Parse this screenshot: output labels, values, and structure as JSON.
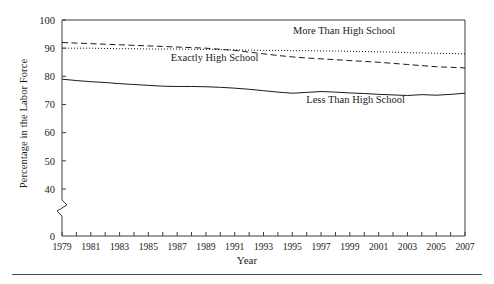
{
  "chart_data": {
    "type": "line",
    "title": "",
    "xlabel": "Year",
    "ylabel": "Percentage in the Labor Force",
    "xlim": [
      1979,
      2007
    ],
    "ylim": [
      0,
      100
    ],
    "y_ticks": [
      0,
      40,
      50,
      60,
      70,
      80,
      90,
      100
    ],
    "y_axis_break": true,
    "y_axis_break_between": [
      0,
      40
    ],
    "grid": false,
    "legend_position": "inline-annotations",
    "x": [
      1979,
      1980,
      1981,
      1982,
      1983,
      1984,
      1985,
      1986,
      1987,
      1988,
      1989,
      1990,
      1991,
      1992,
      1993,
      1994,
      1995,
      1996,
      1997,
      1998,
      1999,
      2000,
      2001,
      2002,
      2003,
      2004,
      2005,
      2006,
      2007
    ],
    "x_tick_labels": [
      "1979",
      "1981",
      "1983",
      "1985",
      "1987",
      "1989",
      "1991",
      "1993",
      "1995",
      "1997",
      "1999",
      "2001",
      "2003",
      "2005",
      "2007"
    ],
    "series": [
      {
        "name": "More Than High School",
        "style": "dotted",
        "label_x": 1998.6,
        "label_y": 95.2,
        "values": [
          90.0,
          90.0,
          90.0,
          89.9,
          89.8,
          89.8,
          89.7,
          89.7,
          89.7,
          89.6,
          89.6,
          89.5,
          89.4,
          89.3,
          89.2,
          89.2,
          89.1,
          89.1,
          89.0,
          89.0,
          88.9,
          88.8,
          88.7,
          88.6,
          88.4,
          88.3,
          88.2,
          88.1,
          88.0
        ]
      },
      {
        "name": "Exactly High School",
        "style": "dashed",
        "label_x": 1989.6,
        "label_y": 85.4,
        "values": [
          92.0,
          91.8,
          91.6,
          91.4,
          91.2,
          91.0,
          90.8,
          90.6,
          90.4,
          90.2,
          90.0,
          89.6,
          89.2,
          88.6,
          88.0,
          87.4,
          86.9,
          86.5,
          86.2,
          85.9,
          85.6,
          85.3,
          85.0,
          84.6,
          84.2,
          83.8,
          83.4,
          83.2,
          83.0
        ]
      },
      {
        "name": "Less Than High School",
        "style": "solid",
        "label_x": 1999.4,
        "label_y": 70.6,
        "values": [
          79.0,
          78.5,
          78.1,
          77.8,
          77.4,
          77.1,
          76.8,
          76.5,
          76.4,
          76.4,
          76.3,
          76.1,
          75.8,
          75.4,
          74.9,
          74.4,
          74.0,
          74.3,
          74.6,
          74.4,
          74.1,
          73.9,
          73.6,
          73.4,
          73.2,
          73.5,
          73.3,
          73.6,
          74.0
        ]
      }
    ]
  }
}
